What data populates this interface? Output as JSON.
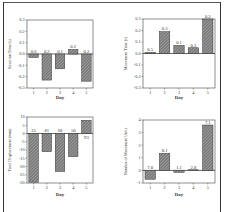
{
  "chart_data": [
    {
      "type": "bar",
      "position": "top-left",
      "title": "",
      "xlabel": "Day",
      "ylabel": "Reaction Time (s)",
      "categories": [
        "1",
        "2",
        "3",
        "4",
        "5"
      ],
      "values": [
        -0.03,
        -0.23,
        -0.13,
        0.04,
        -0.24
      ],
      "bar_labels": [
        "0.6",
        "0.2",
        "0.1",
        "0.2",
        "0.2"
      ],
      "ylim": [
        -0.3,
        0.3
      ],
      "yticks": [
        "0.3",
        "0.2",
        "0.1",
        "0.0",
        "-0.1",
        "-0.2",
        "-0.3"
      ],
      "grid": false
    },
    {
      "type": "bar",
      "position": "top-right",
      "title": "",
      "xlabel": "Day",
      "ylabel": "Movement Time (s)",
      "categories": [
        "1",
        "2",
        "3",
        "4",
        "5"
      ],
      "values": [
        0.01,
        0.19,
        0.07,
        0.05,
        0.3
      ],
      "bar_labels": [
        "0.5",
        "0.3",
        "0.1",
        "0.2",
        "0.3"
      ],
      "ylim": [
        -0.3,
        0.3
      ],
      "yticks": [
        "0.3",
        "0.2",
        "0.1",
        "0.0",
        "-0.1",
        "-0.2",
        "-0.3"
      ],
      "grid": false
    },
    {
      "type": "bar",
      "position": "bottom-left",
      "title": "",
      "xlabel": "Day",
      "ylabel": "Total Displacement (mm)",
      "categories": [
        "1",
        "2",
        "3",
        "4",
        "5"
      ],
      "values": [
        -29.5,
        -11,
        -23,
        -14,
        8
      ],
      "bar_labels": [
        "25",
        "81",
        "60",
        "50",
        "93"
      ],
      "ylim": [
        -30,
        10
      ],
      "yticks": [
        "10",
        "5",
        "0",
        "-5",
        "-10",
        "-15",
        "-20",
        "-25",
        "-30"
      ],
      "grid": false
    },
    {
      "type": "bar",
      "position": "bottom-right",
      "title": "",
      "xlabel": "Day",
      "ylabel": "Number of Movement Units",
      "categories": [
        "1",
        "2",
        "3",
        "4",
        "5"
      ],
      "values": [
        -0.7,
        1.35,
        -0.15,
        0.05,
        3.6
      ],
      "bar_labels": [
        "7.0",
        "8.1",
        "1.1",
        "2.8",
        "7.1"
      ],
      "ylim": [
        -1,
        4
      ],
      "yticks": [
        "4",
        "3",
        "2",
        "1",
        "0",
        "-1"
      ],
      "grid": false
    }
  ],
  "style": {
    "bar_fill": "#6e6e6e",
    "bar_hatch": "#cfcfcf",
    "axis_color": "#333333",
    "background": "#ffffff"
  }
}
